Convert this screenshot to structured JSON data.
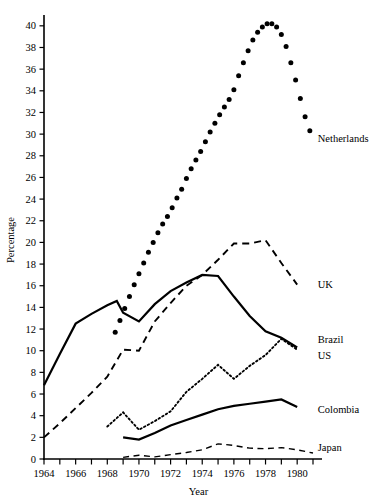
{
  "chart_data": {
    "type": "line",
    "title": "",
    "xlabel": "Year",
    "ylabel": "Percentage",
    "xlim": [
      1964,
      1981
    ],
    "ylim": [
      0,
      41
    ],
    "grid": false,
    "legend_position": "right-inline",
    "x_ticks_all": [
      1964,
      1965,
      1966,
      1967,
      1968,
      1969,
      1970,
      1971,
      1972,
      1973,
      1974,
      1975,
      1976,
      1977,
      1978,
      1979,
      1980,
      1981
    ],
    "x_tick_labels": [
      "1964",
      "1966",
      "1968",
      "1970",
      "1972",
      "1974",
      "1976",
      "1978",
      "1980"
    ],
    "x_tick_label_values": [
      1964,
      1966,
      1968,
      1970,
      1972,
      1974,
      1976,
      1978,
      1980
    ],
    "y_ticks": [
      0,
      2,
      4,
      6,
      8,
      10,
      12,
      14,
      16,
      18,
      20,
      22,
      24,
      26,
      28,
      30,
      32,
      34,
      36,
      38,
      40
    ],
    "y_tick_labels": [
      "0",
      "2",
      "4",
      "6",
      "8",
      "10",
      "12",
      "14",
      "16",
      "18",
      "20",
      "22",
      "24",
      "26",
      "28",
      "30",
      "32",
      "34",
      "36",
      "38",
      "40"
    ],
    "series": [
      {
        "name": "Netherlands",
        "style": "dotted-markers",
        "label": "Netherlands",
        "x": [
          1968.5,
          1968.8,
          1969.1,
          1969.4,
          1969.7,
          1970.0,
          1970.3,
          1970.6,
          1970.9,
          1971.2,
          1971.5,
          1971.8,
          1972.1,
          1972.4,
          1972.7,
          1973.0,
          1973.3,
          1973.6,
          1973.9,
          1974.2,
          1974.5,
          1974.8,
          1975.1,
          1975.4,
          1975.7,
          1976.0,
          1976.3,
          1976.6,
          1976.9,
          1977.2,
          1977.5,
          1977.8,
          1978.1,
          1978.4,
          1978.7,
          1979.0,
          1979.3,
          1979.6,
          1979.9,
          1980.2,
          1980.5,
          1980.8
        ],
        "values": [
          11.7,
          12.8,
          13.9,
          15.0,
          16.1,
          17.1,
          18.1,
          19.1,
          20.0,
          20.9,
          21.7,
          22.4,
          23.2,
          24.1,
          24.9,
          25.9,
          26.8,
          27.6,
          28.4,
          29.3,
          30.2,
          31.0,
          31.8,
          32.5,
          33.2,
          34.1,
          35.4,
          36.6,
          37.7,
          38.7,
          39.4,
          39.9,
          40.2,
          40.2,
          39.9,
          39.2,
          38.1,
          36.6,
          35.0,
          33.3,
          31.6,
          30.3
        ]
      },
      {
        "name": "UK",
        "style": "dashed",
        "label": "UK",
        "x": [
          1964,
          1965,
          1966,
          1967,
          1968,
          1969,
          1970,
          1971,
          1972,
          1973,
          1974,
          1975,
          1976,
          1977,
          1978,
          1979,
          1980
        ],
        "values": [
          2.0,
          3.3,
          4.7,
          6.1,
          7.6,
          10.1,
          10.0,
          12.7,
          14.4,
          16.0,
          17.0,
          18.4,
          19.9,
          19.9,
          20.2,
          18.1,
          16.1
        ]
      },
      {
        "name": "US",
        "style": "solid-thick",
        "label": "US",
        "x": [
          1964,
          1965,
          1966,
          1967,
          1968,
          1968.6,
          1969,
          1970,
          1971,
          1972,
          1973,
          1974,
          1975,
          1976,
          1977,
          1978,
          1979,
          1980
        ],
        "values": [
          6.8,
          9.7,
          12.5,
          13.4,
          14.2,
          14.6,
          13.5,
          12.7,
          14.3,
          15.5,
          16.3,
          17.0,
          16.9,
          15.0,
          13.2,
          11.8,
          11.2,
          10.3
        ]
      },
      {
        "name": "Brazil",
        "style": "dotted",
        "label": "Brazil",
        "x": [
          1968,
          1969,
          1970,
          1971,
          1972,
          1973,
          1974,
          1975,
          1976,
          1977,
          1978,
          1979,
          1980
        ],
        "values": [
          3.0,
          4.3,
          2.7,
          3.5,
          4.4,
          6.2,
          7.4,
          8.7,
          7.4,
          8.6,
          9.6,
          11.1,
          10.1
        ]
      },
      {
        "name": "Colombia",
        "style": "solid-thick",
        "label": "Colombia",
        "x": [
          1969,
          1970,
          1971,
          1972,
          1973,
          1974,
          1975,
          1976,
          1977,
          1978,
          1979,
          1980
        ],
        "values": [
          2.0,
          1.8,
          2.4,
          3.1,
          3.6,
          4.1,
          4.6,
          4.9,
          5.1,
          5.3,
          5.5,
          4.8
        ]
      },
      {
        "name": "Japan",
        "style": "dashed-thin",
        "label": "Japan",
        "x": [
          1969,
          1970,
          1971,
          1972,
          1973,
          1974,
          1975,
          1976,
          1977,
          1978,
          1979,
          1980,
          1981
        ],
        "values": [
          0.15,
          0.35,
          0.2,
          0.4,
          0.6,
          0.85,
          1.4,
          1.25,
          1.0,
          0.95,
          1.05,
          0.85,
          0.55
        ]
      }
    ],
    "series_labels": [
      {
        "name": "Netherlands",
        "x": 1981.05,
        "y": 29.6
      },
      {
        "name": "UK",
        "x": 1981.05,
        "y": 16.1
      },
      {
        "name": "Brazil",
        "x": 1981.05,
        "y": 11.0
      },
      {
        "name": "US",
        "x": 1981.05,
        "y": 9.6
      },
      {
        "name": "Colombia",
        "x": 1981.05,
        "y": 4.6
      },
      {
        "name": "Japan",
        "x": 1981.05,
        "y": 1.1
      }
    ]
  }
}
